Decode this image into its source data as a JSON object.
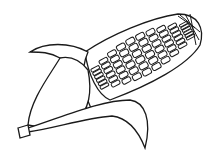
{
  "image": {
    "subject": "corn cob line drawing",
    "stroke_color": "#1a1a1a",
    "background_color": "#ffffff",
    "kernel_rows": 6,
    "kernel_cols": 10
  }
}
